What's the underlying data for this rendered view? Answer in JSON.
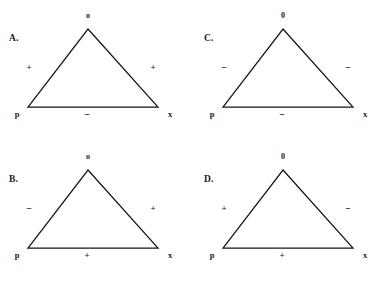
{
  "figure": {
    "background_color": "#ffffff",
    "line_color": "#141414",
    "text_color": "#1a1a1a"
  },
  "panels": [
    {
      "id": "A",
      "letter": "A.",
      "vertex_top": "o",
      "vertex_left": "p",
      "vertex_right": "x",
      "sign_left": "+",
      "sign_right": "+",
      "sign_bottom": "−"
    },
    {
      "id": "C",
      "letter": "C.",
      "vertex_top": "0",
      "vertex_left": "p",
      "vertex_right": "x",
      "sign_left": "−",
      "sign_right": "−",
      "sign_bottom": "−"
    },
    {
      "id": "B",
      "letter": "B.",
      "vertex_top": "o",
      "vertex_left": "p",
      "vertex_right": "x",
      "sign_left": "−",
      "sign_right": "+",
      "sign_bottom": "+"
    },
    {
      "id": "D",
      "letter": "D.",
      "vertex_top": "0",
      "vertex_left": "p",
      "vertex_right": "x",
      "sign_left": "+",
      "sign_right": "−",
      "sign_bottom": "+"
    }
  ]
}
